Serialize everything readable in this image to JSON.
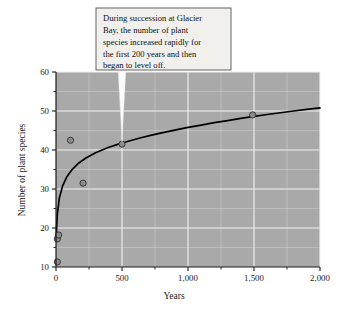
{
  "chart_data": {
    "type": "scatter",
    "title": "",
    "xlabel": "Years",
    "ylabel": "Number of plant species",
    "xlim": [
      0,
      2000
    ],
    "ylim": [
      10,
      60
    ],
    "grid": true,
    "legend": "none",
    "x_ticks": [
      0,
      500,
      1000,
      1500,
      2000
    ],
    "x_tick_labels": [
      "0",
      "500",
      "1,000",
      "1,500",
      "2,000"
    ],
    "x_minor_ticks": [
      250,
      750,
      1250,
      1750
    ],
    "y_ticks": [
      10,
      20,
      30,
      40,
      50,
      60
    ],
    "y_tick_labels": [
      "10",
      "20",
      "30",
      "40",
      "50",
      "60"
    ],
    "y_minor_ticks": [
      15,
      25,
      35,
      45,
      55
    ],
    "points": [
      {
        "x": 10,
        "y": 11.3
      },
      {
        "x": 10,
        "y": 17.2
      },
      {
        "x": 20,
        "y": 18.2
      },
      {
        "x": 110,
        "y": 42.5
      },
      {
        "x": 205,
        "y": 31.5
      },
      {
        "x": 500,
        "y": 41.5
      },
      {
        "x": 1490,
        "y": 49.0
      }
    ],
    "fit_curve": {
      "description": "logarithmic trend line",
      "points": [
        {
          "x": 0,
          "y": 17.0
        },
        {
          "x": 10,
          "y": 23.5
        },
        {
          "x": 25,
          "y": 27.6
        },
        {
          "x": 50,
          "y": 30.8
        },
        {
          "x": 80,
          "y": 33.0
        },
        {
          "x": 120,
          "y": 34.9
        },
        {
          "x": 170,
          "y": 36.6
        },
        {
          "x": 230,
          "y": 38.0
        },
        {
          "x": 300,
          "y": 39.3
        },
        {
          "x": 400,
          "y": 40.7
        },
        {
          "x": 500,
          "y": 41.8
        },
        {
          "x": 650,
          "y": 43.2
        },
        {
          "x": 800,
          "y": 44.4
        },
        {
          "x": 1000,
          "y": 45.8
        },
        {
          "x": 1200,
          "y": 47.0
        },
        {
          "x": 1400,
          "y": 48.1
        },
        {
          "x": 1600,
          "y": 49.1
        },
        {
          "x": 1800,
          "y": 50.0
        },
        {
          "x": 2000,
          "y": 50.8
        }
      ]
    },
    "annotations": [
      {
        "name": "succession-callout",
        "text": "During succession at Glacier Bay, the number of plant species increased rapidly for the first 200 years and then began to level off.",
        "lines": [
          "During succession at Glacier",
          "Bay, the number of plant",
          "species increased rapidly for",
          "the first 200 years and then",
          "began to level off."
        ],
        "points_to": {
          "x": 500,
          "y": 41.5
        }
      }
    ]
  },
  "colors": {
    "page_background": "#ffffff",
    "plot_background": "#a9a9a9",
    "gridline": "#f2f2f2",
    "axis": "#1a1a1a",
    "curve": "#000000",
    "marker_fill": "#8c8c8c",
    "marker_stroke": "#3a3a3a",
    "callout_background": "#f2f0ec",
    "callout_border": "#555555",
    "callout_pointer": "#fbfbfb",
    "text": "#1a1a1a"
  }
}
